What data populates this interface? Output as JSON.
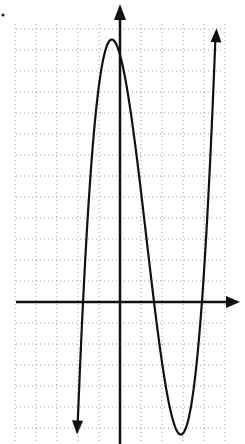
{
  "chart_data": {
    "type": "line",
    "title": "",
    "xlabel": "",
    "ylabel": "",
    "grid": true,
    "grid_style": "dotted",
    "legend": null,
    "pixel_frame": {
      "origin_px": [
        120,
        302
      ],
      "grid_spacing_px": 21,
      "grid_left_px": 16,
      "grid_right_px": 224,
      "grid_top_px": 24,
      "grid_bottom_px": 444
    },
    "series": [
      {
        "name": "cubic",
        "x_intercepts_grid_units": [
          -1.76,
          1.62,
          3.9
        ],
        "local_max_grid_units": [
          -0.38,
          12.5
        ],
        "local_min_grid_units": [
          2.86,
          -6.2
        ],
        "end_behavior": {
          "left": "down-arrow",
          "right": "up-arrow"
        },
        "color": "#111111"
      }
    ],
    "axes": {
      "x_axis_arrow": "right",
      "y_axis_arrow": "up",
      "tick_labels": []
    },
    "annotations": [
      {
        "type": "dot",
        "position_px": [
          3,
          15
        ]
      }
    ]
  }
}
